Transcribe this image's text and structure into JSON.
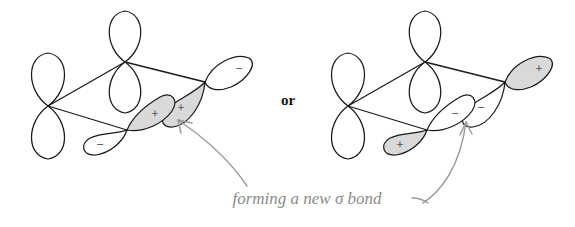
{
  "figure": {
    "type": "orbital-overlap-diagram",
    "background_color": "#ffffff",
    "connector_label": "or",
    "caption": "forming a new σ bond",
    "caption_color": "#8a8a8a",
    "arrow_color": "#9a9a9a",
    "outline_color": "#1a1a1a",
    "shaded_lobe_color": "#d9d9d9",
    "unshaded_lobe_color": "#ffffff"
  },
  "structures": [
    {
      "id": "left",
      "name": "left-orbital-structure",
      "orbitals": [
        {
          "name": "left-p-orbital",
          "orientation": "vertical",
          "lobes": [
            {
              "position": "top",
              "shaded": false,
              "sign": ""
            },
            {
              "position": "bottom",
              "shaded": false,
              "sign": ""
            }
          ]
        },
        {
          "name": "center-p-orbital",
          "orientation": "vertical",
          "lobes": [
            {
              "position": "top",
              "shaded": false,
              "sign": ""
            },
            {
              "position": "bottom",
              "shaded": false,
              "sign": ""
            }
          ]
        },
        {
          "name": "upper-right-p-orbital",
          "orientation": "tilted",
          "lobes": [
            {
              "position": "outer",
              "shaded": false,
              "sign": "−"
            },
            {
              "position": "inner",
              "shaded": true,
              "sign": "+"
            }
          ]
        },
        {
          "name": "lower-left-p-orbital",
          "orientation": "tilted",
          "lobes": [
            {
              "position": "outer",
              "shaded": false,
              "sign": "−"
            },
            {
              "position": "inner",
              "shaded": true,
              "sign": "+"
            }
          ]
        }
      ]
    },
    {
      "id": "right",
      "name": "right-orbital-structure",
      "orbitals": [
        {
          "name": "left-p-orbital",
          "orientation": "vertical",
          "lobes": [
            {
              "position": "top",
              "shaded": false,
              "sign": ""
            },
            {
              "position": "bottom",
              "shaded": false,
              "sign": ""
            }
          ]
        },
        {
          "name": "center-p-orbital",
          "orientation": "vertical",
          "lobes": [
            {
              "position": "top",
              "shaded": false,
              "sign": ""
            },
            {
              "position": "bottom",
              "shaded": false,
              "sign": ""
            }
          ]
        },
        {
          "name": "upper-right-p-orbital",
          "orientation": "tilted",
          "lobes": [
            {
              "position": "outer",
              "shaded": true,
              "sign": "+"
            },
            {
              "position": "inner",
              "shaded": false,
              "sign": "−"
            }
          ]
        },
        {
          "name": "lower-left-p-orbital",
          "orientation": "tilted",
          "lobes": [
            {
              "position": "outer",
              "shaded": true,
              "sign": "+"
            },
            {
              "position": "inner",
              "shaded": false,
              "sign": "−"
            }
          ]
        }
      ]
    }
  ],
  "signs": {
    "left_upper_outer": "−",
    "left_upper_inner": "+",
    "left_lower_outer": "−",
    "left_lower_inner": "+",
    "right_upper_outer": "+",
    "right_upper_inner": "−",
    "right_lower_outer": "+",
    "right_lower_inner": "−"
  }
}
